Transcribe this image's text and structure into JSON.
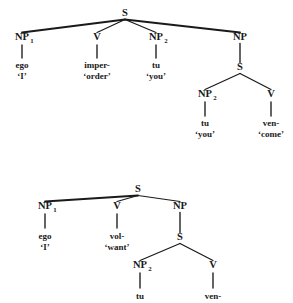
{
  "figure": {
    "type": "syntactic-tree-diagram",
    "ink_color": "#1a1a1a",
    "background_color": "#ffffff"
  },
  "trees": [
    {
      "id": "tree-upper",
      "name": "imperative-causative-tree",
      "nodes": [
        {
          "id": "u-S0",
          "label": "S",
          "sub": "",
          "x": 125,
          "y": 16,
          "kind": "nonterminal"
        },
        {
          "id": "u-NP1",
          "label": "NP",
          "sub": "1",
          "x": 22,
          "y": 40,
          "kind": "nonterminal"
        },
        {
          "id": "u-V1",
          "label": "V",
          "sub": "",
          "x": 97,
          "y": 40,
          "kind": "nonterminal"
        },
        {
          "id": "u-NP2",
          "label": "NP",
          "sub": "2",
          "x": 156,
          "y": 40,
          "kind": "nonterminal"
        },
        {
          "id": "u-NP3",
          "label": "NP",
          "sub": "",
          "x": 240,
          "y": 40,
          "kind": "nonterminal"
        },
        {
          "id": "u-S1",
          "label": "S",
          "sub": "",
          "x": 240,
          "y": 70,
          "kind": "nonterminal"
        },
        {
          "id": "u-NP4",
          "label": "NP",
          "sub": "2",
          "x": 205,
          "y": 97,
          "kind": "nonterminal"
        },
        {
          "id": "u-V2",
          "label": "V",
          "sub": "",
          "x": 271,
          "y": 97,
          "kind": "nonterminal"
        }
      ],
      "edges": [
        {
          "from": "u-S0",
          "to": "u-NP1",
          "weight": "thick"
        },
        {
          "from": "u-S0",
          "to": "u-V1",
          "weight": "normal"
        },
        {
          "from": "u-S0",
          "to": "u-NP2",
          "weight": "normal"
        },
        {
          "from": "u-S0",
          "to": "u-NP3",
          "weight": "thick"
        },
        {
          "from": "u-NP3",
          "to": "u-S1",
          "weight": "stem"
        },
        {
          "from": "u-S1",
          "to": "u-NP4",
          "weight": "normal"
        },
        {
          "from": "u-S1",
          "to": "u-V2",
          "weight": "normal"
        }
      ],
      "leaves": [
        {
          "parent": "u-NP1",
          "x": 22,
          "stem_top": 45,
          "stem_bottom": 58,
          "word": "ego",
          "word_y": 68,
          "gloss": "‘I’",
          "gloss_y": 79
        },
        {
          "parent": "u-V1",
          "x": 97,
          "stem_top": 45,
          "stem_bottom": 58,
          "word": "imper-",
          "word_y": 68,
          "gloss": "‘order’",
          "gloss_y": 79
        },
        {
          "parent": "u-NP2",
          "x": 156,
          "stem_top": 45,
          "stem_bottom": 58,
          "word": "tu",
          "word_y": 68,
          "gloss": "‘you’",
          "gloss_y": 79
        },
        {
          "parent": "u-NP4",
          "x": 205,
          "stem_top": 102,
          "stem_bottom": 116,
          "word": "tu",
          "word_y": 126,
          "gloss": "‘you’",
          "gloss_y": 137
        },
        {
          "parent": "u-V2",
          "x": 271,
          "stem_top": 102,
          "stem_bottom": 116,
          "word": "ven-",
          "word_y": 126,
          "gloss": "‘come’",
          "gloss_y": 137
        }
      ]
    },
    {
      "id": "tree-lower",
      "name": "volitional-tree",
      "nodes": [
        {
          "id": "l-S0",
          "label": "S",
          "sub": "",
          "x": 138,
          "y": 192,
          "kind": "nonterminal"
        },
        {
          "id": "l-NP1",
          "label": "NP",
          "sub": "1",
          "x": 45,
          "y": 209,
          "kind": "nonterminal"
        },
        {
          "id": "l-V1",
          "label": "V",
          "sub": "",
          "x": 117,
          "y": 209,
          "kind": "nonterminal"
        },
        {
          "id": "l-NP3",
          "label": "NP",
          "sub": "",
          "x": 180,
          "y": 209,
          "kind": "nonterminal"
        },
        {
          "id": "l-S1",
          "label": "S",
          "sub": "",
          "x": 180,
          "y": 240,
          "kind": "nonterminal"
        },
        {
          "id": "l-NP4",
          "label": "NP",
          "sub": "2",
          "x": 140,
          "y": 268,
          "kind": "nonterminal"
        },
        {
          "id": "l-V2",
          "label": "V",
          "sub": "",
          "x": 213,
          "y": 268,
          "kind": "nonterminal"
        }
      ],
      "edges": [
        {
          "from": "l-S0",
          "to": "l-NP1",
          "weight": "thick"
        },
        {
          "from": "l-S0",
          "to": "l-V1",
          "weight": "normal"
        },
        {
          "from": "l-S0",
          "to": "l-NP3",
          "weight": "normal"
        },
        {
          "from": "l-NP3",
          "to": "l-S1",
          "weight": "stem"
        },
        {
          "from": "l-S1",
          "to": "l-NP4",
          "weight": "normal"
        },
        {
          "from": "l-S1",
          "to": "l-V2",
          "weight": "normal"
        }
      ],
      "leaves": [
        {
          "parent": "l-NP1",
          "x": 45,
          "stem_top": 214,
          "stem_bottom": 228,
          "word": "ego",
          "word_y": 239,
          "gloss": "‘I’",
          "gloss_y": 250
        },
        {
          "parent": "l-V1",
          "x": 117,
          "stem_top": 214,
          "stem_bottom": 228,
          "word": "vol-",
          "word_y": 239,
          "gloss": "‘want’",
          "gloss_y": 250
        },
        {
          "parent": "l-NP4",
          "x": 140,
          "stem_top": 273,
          "stem_bottom": 288,
          "word": "tu",
          "word_y": 299,
          "gloss": "",
          "gloss_y": 0
        },
        {
          "parent": "l-V2",
          "x": 213,
          "stem_top": 273,
          "stem_bottom": 288,
          "word": "ven-",
          "word_y": 299,
          "gloss": "",
          "gloss_y": 0
        }
      ]
    }
  ]
}
